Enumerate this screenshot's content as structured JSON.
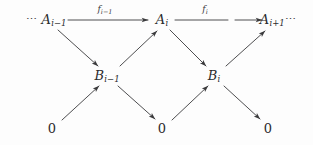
{
  "diagram": {
    "type": "commutative-diagram",
    "ink_color": "#2b2b2d",
    "background_color": "#fdfdfd",
    "rows": {
      "top_y": 20,
      "middle_y": 76,
      "bottom_y": 128
    },
    "nodes": [
      {
        "id": "a-prev",
        "label": "A",
        "subscript": "i−1",
        "leading_ellipsis": "⋯",
        "trailing_ellipsis": "",
        "x": 46,
        "y": 20,
        "row": "top"
      },
      {
        "id": "a-curr",
        "label": "A",
        "subscript": "i",
        "leading_ellipsis": "",
        "trailing_ellipsis": "",
        "x": 162,
        "y": 20,
        "row": "top"
      },
      {
        "id": "a-next",
        "label": "A",
        "subscript": "i+1",
        "leading_ellipsis": "",
        "trailing_ellipsis": "⋯",
        "x": 276,
        "y": 20,
        "row": "top"
      },
      {
        "id": "b-prev",
        "label": "B",
        "subscript": "i−1",
        "leading_ellipsis": "",
        "trailing_ellipsis": "",
        "x": 107,
        "y": 76,
        "row": "middle"
      },
      {
        "id": "b-curr",
        "label": "B",
        "subscript": "i",
        "leading_ellipsis": "",
        "trailing_ellipsis": "",
        "x": 214,
        "y": 76,
        "row": "middle"
      },
      {
        "id": "zero-left",
        "label": "0",
        "subscript": "",
        "leading_ellipsis": "",
        "trailing_ellipsis": "",
        "x": 52,
        "y": 128,
        "row": "bottom"
      },
      {
        "id": "zero-middle",
        "label": "0",
        "subscript": "",
        "leading_ellipsis": "",
        "trailing_ellipsis": "",
        "x": 162,
        "y": 128,
        "row": "bottom"
      },
      {
        "id": "zero-right",
        "label": "0",
        "subscript": "",
        "leading_ellipsis": "",
        "trailing_ellipsis": "",
        "x": 268,
        "y": 128,
        "row": "bottom"
      }
    ],
    "arrow_labels": [
      {
        "id": "f-prev",
        "label": "f",
        "subscript": "i−1",
        "x": 105,
        "y": 10
      },
      {
        "id": "f-curr",
        "label": "f",
        "subscript": "i",
        "x": 205,
        "y": 10
      }
    ],
    "arrows": [
      {
        "id": "a-prev-to-a-curr",
        "from": "a-prev",
        "to": "a-curr",
        "kind": "horizontal",
        "labeled_by": "f-prev"
      },
      {
        "id": "a-curr-to-a-next",
        "from": "a-curr",
        "to": "a-next",
        "kind": "horizontal-broken",
        "labeled_by": "f-curr"
      },
      {
        "id": "a-prev-to-b-prev",
        "from": "a-prev",
        "to": "b-prev",
        "kind": "diagonal-down"
      },
      {
        "id": "b-prev-to-a-curr",
        "from": "b-prev",
        "to": "a-curr",
        "kind": "diagonal-up"
      },
      {
        "id": "a-curr-to-b-curr",
        "from": "a-curr",
        "to": "b-curr",
        "kind": "diagonal-down"
      },
      {
        "id": "b-curr-to-a-next",
        "from": "b-curr",
        "to": "a-next",
        "kind": "diagonal-up"
      },
      {
        "id": "zero-left-to-b-prev",
        "from": "zero-left",
        "to": "b-prev",
        "kind": "diagonal-up"
      },
      {
        "id": "b-prev-to-zero-middle",
        "from": "b-prev",
        "to": "zero-middle",
        "kind": "diagonal-down"
      },
      {
        "id": "zero-middle-to-b-curr",
        "from": "zero-middle",
        "to": "b-curr",
        "kind": "diagonal-up"
      },
      {
        "id": "b-curr-to-zero-right",
        "from": "b-curr",
        "to": "zero-right",
        "kind": "diagonal-down"
      }
    ]
  }
}
